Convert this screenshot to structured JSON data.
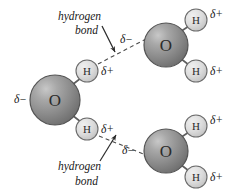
{
  "figure": {
    "background_color": "#ffffff"
  },
  "colors": {
    "oxygen_fill_dark": "#7d7d7d",
    "oxygen_fill_mid": "#9a9a9a",
    "oxygen_highlight": "#cfcfcf",
    "oxygen_stroke": "#4f4f4f",
    "hydrogen_fill": "#d9d9d9",
    "hydrogen_highlight": "#f0f0f0",
    "hydrogen_stroke": "#6b6b6b",
    "bond_stroke": "#5e5e5e",
    "hbond_stroke": "#4a4a4a",
    "text_color": "#1a1a1a"
  },
  "molecules": [
    {
      "id": "water-left",
      "oxygen": {
        "label": "O",
        "cx": 55,
        "cy": 100,
        "r": 25
      },
      "oxygen_charge": {
        "label": "δ−",
        "x": 14,
        "y": 103
      },
      "hydrogens": [
        {
          "label": "H",
          "cx": 87,
          "cy": 71,
          "r": 11,
          "charge": "δ+",
          "charge_x": 101,
          "charge_y": 75
        },
        {
          "label": "H",
          "cx": 87,
          "cy": 129,
          "r": 11,
          "charge": "δ+",
          "charge_x": 101,
          "charge_y": 133
        }
      ]
    },
    {
      "id": "water-top-right",
      "oxygen": {
        "label": "O",
        "cx": 166,
        "cy": 45,
        "r": 22
      },
      "oxygen_charge": {
        "label": "δ−",
        "x": 120,
        "y": 43
      },
      "hydrogens": [
        {
          "label": "H",
          "cx": 196,
          "cy": 20,
          "r": 11,
          "charge": "δ+",
          "charge_x": 210,
          "charge_y": 18
        },
        {
          "label": "H",
          "cx": 196,
          "cy": 71,
          "r": 11,
          "charge": "δ+",
          "charge_x": 210,
          "charge_y": 75
        }
      ]
    },
    {
      "id": "water-bottom-right",
      "oxygen": {
        "label": "O",
        "cx": 166,
        "cy": 151,
        "r": 22
      },
      "oxygen_charge": {
        "label": "δ−",
        "x": 122,
        "y": 154
      },
      "hydrogens": [
        {
          "label": "H",
          "cx": 196,
          "cy": 126,
          "r": 11,
          "charge": "δ+",
          "charge_x": 210,
          "charge_y": 124
        },
        {
          "label": "H",
          "cx": 196,
          "cy": 177,
          "r": 11,
          "charge": "δ+",
          "charge_x": 210,
          "charge_y": 181
        }
      ]
    }
  ],
  "hydrogen_bonds": [
    {
      "id": "hbond-upper",
      "caption_line1": "hydrogen",
      "caption_line2": "bond",
      "caption_x": 58,
      "caption_y1": 20,
      "caption_y2": 34,
      "dash_x1": 98,
      "dash_y1": 64,
      "dash_x2": 146,
      "dash_y2": 39,
      "pointer_x1": 102,
      "pointer_y1": 26,
      "pointer_x2": 115,
      "pointer_y2": 52
    },
    {
      "id": "hbond-lower",
      "caption_line1": "hydrogen",
      "caption_line2": "bond",
      "caption_x": 58,
      "caption_y1": 170,
      "caption_y2": 185,
      "dash_x1": 99,
      "dash_y1": 136,
      "dash_x2": 146,
      "dash_y2": 155,
      "pointer_x1": 100,
      "pointer_y1": 161,
      "pointer_x2": 116,
      "pointer_y2": 135
    }
  ]
}
